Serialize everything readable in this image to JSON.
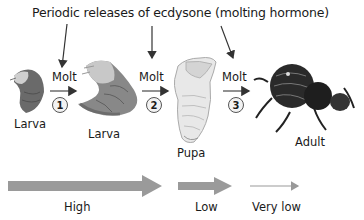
{
  "title": "Periodic releases of ecdysone (molting hormone)",
  "stages": [
    {
      "label": "Larva"
    },
    {
      "label": "Larva"
    },
    {
      "label": "Pupa"
    },
    {
      "label": "Adult"
    }
  ],
  "molts": [
    {
      "label": "Molt",
      "number": "1"
    },
    {
      "label": "Molt",
      "number": "2"
    },
    {
      "label": "Molt",
      "number": "3"
    }
  ],
  "hormone_levels": [
    {
      "label": "High"
    },
    {
      "label": "Low"
    },
    {
      "label": "Very low"
    }
  ],
  "colors": {
    "level_arrow": "#9a9a9a",
    "text": "#1a1a1a",
    "pointer_arrow": "#333333"
  }
}
